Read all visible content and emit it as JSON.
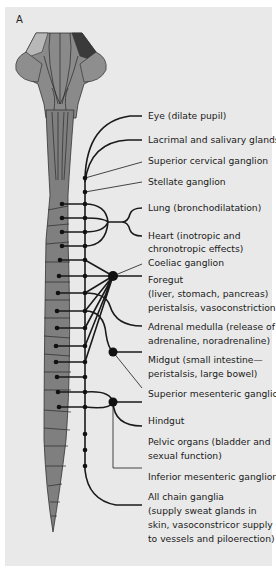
{
  "figure": {
    "panel_label": "A",
    "colors": {
      "background": "#e9e9e9",
      "cord_fill": "#7f7f7f",
      "line": "#1a1a1a"
    }
  },
  "labels": {
    "eye": [
      "Eye (dilate pupil)"
    ],
    "lacrimal": [
      "Lacrimal and salivary glands"
    ],
    "superior_cervical": [
      "Superior cervical ganglion"
    ],
    "stellate": [
      "Stellate ganglion"
    ],
    "lung": [
      "Lung (bronchodilatation)"
    ],
    "heart": [
      "Heart (inotropic and",
      "chronotropic effects)"
    ],
    "coeliac": [
      "Coeliac ganglion"
    ],
    "foregut": [
      "Foregut",
      "(liver, stomach, pancreas)",
      "peristalsis, vasoconstriction"
    ],
    "adrenal": [
      "Adrenal medulla (release of",
      "adrenaline, noradrenaline)"
    ],
    "midgut": [
      "Midgut (small intestine—",
      "peristalsis, large bowel)"
    ],
    "superior_mesenteric": [
      "Superior mesenteric ganglion"
    ],
    "hindgut": [
      "Hindgut"
    ],
    "pelvic": [
      "Pelvic organs (bladder and",
      "sexual function)"
    ],
    "inferior_mesenteric": [
      "Inferior mesenteric ganglion"
    ],
    "all_chain": [
      "All chain ganglia",
      "(supply sweat glands in",
      "skin, vasoconstricor supply",
      "to vessels and piloerection)"
    ]
  }
}
